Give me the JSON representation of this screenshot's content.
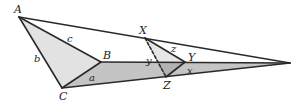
{
  "diagram": {
    "colors": {
      "stroke": "#2a2a2a",
      "light_fill": "#e2e2e2",
      "strip_fill": "#c4c4c4",
      "overlap_fill": "#b2b2b2"
    },
    "vertices": {
      "A": {
        "label": "A",
        "x": 19,
        "y": 17
      },
      "B": {
        "label": "B",
        "x": 101,
        "y": 62
      },
      "C": {
        "label": "C",
        "x": 62,
        "y": 88
      },
      "X": {
        "label": "X",
        "x": 145,
        "y": 38
      },
      "Y": {
        "label": "Y",
        "x": 185,
        "y": 62
      },
      "Z": {
        "label": "Z",
        "x": 166,
        "y": 77
      },
      "tip": {
        "x": 290,
        "y": 63
      }
    },
    "side_labels": {
      "a": "a",
      "b": "b",
      "c": "c",
      "x": "x",
      "y": "y",
      "z": "z"
    }
  }
}
